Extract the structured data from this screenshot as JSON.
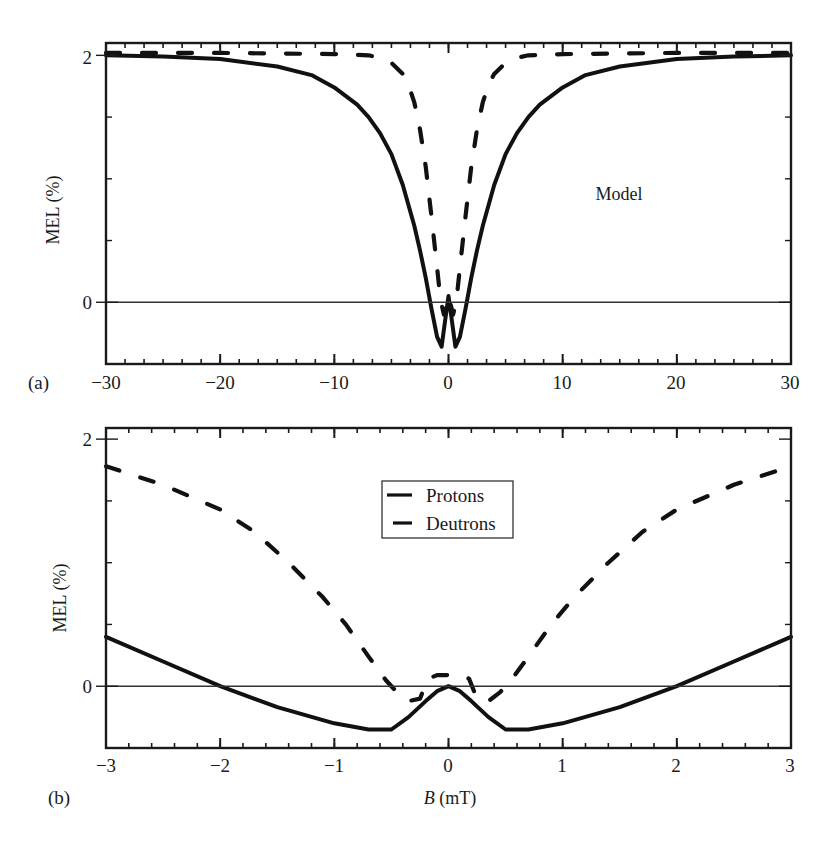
{
  "chart_data": [
    {
      "type": "line",
      "panel_label": "(a)",
      "title": "",
      "annotation": "Model",
      "xlabel": "",
      "ylabel": "MEL (%)",
      "xlim": [
        -30,
        30
      ],
      "ylim": [
        -0.5,
        2.1
      ],
      "xticks": [
        -30,
        -20,
        -10,
        0,
        10,
        20,
        30
      ],
      "xtick_labels": [
        "−30",
        "−20",
        "−10",
        "0",
        "10",
        "20",
        "30"
      ],
      "yticks": [
        0,
        2
      ],
      "ytick_labels": [
        "0",
        "2"
      ],
      "x_minor_step": 1.667,
      "y_minor_step": 0.5,
      "reference_line_y": 0,
      "grid": false,
      "legend": null,
      "series": [
        {
          "name": "Protons",
          "style": "solid",
          "x": [
            -30,
            -25,
            -20,
            -15,
            -12,
            -10,
            -8,
            -7,
            -6,
            -5,
            -4,
            -3,
            -2.5,
            -2,
            -1.5,
            -1,
            -0.6,
            -0.3,
            0,
            0.3,
            0.6,
            1,
            1.5,
            2,
            2.5,
            3,
            4,
            5,
            6,
            7,
            8,
            10,
            12,
            15,
            20,
            25,
            30
          ],
          "y": [
            2.0,
            1.99,
            1.97,
            1.91,
            1.84,
            1.74,
            1.6,
            1.5,
            1.37,
            1.2,
            0.95,
            0.62,
            0.42,
            0.2,
            -0.05,
            -0.28,
            -0.36,
            -0.15,
            0.05,
            -0.15,
            -0.36,
            -0.28,
            -0.05,
            0.2,
            0.42,
            0.62,
            0.95,
            1.2,
            1.37,
            1.5,
            1.6,
            1.74,
            1.84,
            1.91,
            1.97,
            1.99,
            2.0
          ]
        },
        {
          "name": "Deutrons",
          "style": "dashed",
          "x": [
            -30,
            -20,
            -10,
            -7,
            -6,
            -5,
            -4,
            -3.5,
            -3,
            -2.5,
            -2,
            -1.5,
            -1,
            -0.7,
            -0.4,
            0,
            0.4,
            0.7,
            1,
            1.5,
            2,
            2.5,
            3,
            3.5,
            4,
            5,
            6,
            7,
            10,
            20,
            30
          ],
          "y": [
            2.02,
            2.02,
            2.01,
            2.0,
            1.98,
            1.94,
            1.85,
            1.76,
            1.62,
            1.4,
            1.1,
            0.7,
            0.28,
            0.02,
            -0.1,
            0.05,
            -0.1,
            0.02,
            0.28,
            0.7,
            1.1,
            1.4,
            1.62,
            1.76,
            1.85,
            1.94,
            1.98,
            2.0,
            2.01,
            2.02,
            2.02
          ]
        }
      ]
    },
    {
      "type": "line",
      "panel_label": "(b)",
      "title": "",
      "xlabel": "B (mT)",
      "xlabel_italic_part": "B",
      "xlabel_rest": " (mT)",
      "ylabel": "MEL (%)",
      "xlim": [
        -3,
        3
      ],
      "ylim": [
        -0.5,
        2.09
      ],
      "xticks": [
        -3,
        -2,
        -1,
        0,
        1,
        2,
        3
      ],
      "xtick_labels": [
        "−3",
        "−2",
        "−1",
        "0",
        "1",
        "2",
        "3"
      ],
      "yticks": [
        0,
        2
      ],
      "ytick_labels": [
        "0",
        "2"
      ],
      "x_minor_step": 0.2,
      "y_minor_step": 0.5,
      "reference_line_y": 0,
      "grid": false,
      "legend": {
        "placement": "top-center",
        "entries": [
          {
            "label": "Protons",
            "style": "solid"
          },
          {
            "label": "Deutrons",
            "style": "dashed"
          }
        ]
      },
      "series": [
        {
          "name": "Protons",
          "style": "solid",
          "x": [
            -3,
            -2.5,
            -2,
            -1.5,
            -1,
            -0.7,
            -0.5,
            -0.35,
            -0.2,
            -0.1,
            0,
            0.1,
            0.2,
            0.35,
            0.5,
            0.7,
            1,
            1.5,
            2,
            2.5,
            3
          ],
          "y": [
            0.4,
            0.2,
            0.0,
            -0.17,
            -0.3,
            -0.35,
            -0.35,
            -0.25,
            -0.12,
            -0.04,
            0.0,
            -0.04,
            -0.12,
            -0.25,
            -0.35,
            -0.35,
            -0.3,
            -0.17,
            0.0,
            0.2,
            0.4
          ],
          "color": "#111111"
        },
        {
          "name": "Deutrons",
          "style": "dashed",
          "x": [
            -3,
            -2.5,
            -2,
            -1.7,
            -1.4,
            -1.1,
            -0.9,
            -0.7,
            -0.55,
            -0.45,
            -0.35,
            -0.25,
            -0.18,
            -0.1,
            0,
            0.1,
            0.18,
            0.25,
            0.35,
            0.45,
            0.55,
            0.7,
            0.9,
            1.1,
            1.4,
            1.7,
            2,
            2.5,
            3
          ],
          "y": [
            1.78,
            1.63,
            1.43,
            1.25,
            1.0,
            0.72,
            0.5,
            0.24,
            0.05,
            -0.05,
            -0.12,
            -0.1,
            0.06,
            0.09,
            0.09,
            0.09,
            0.06,
            -0.1,
            -0.12,
            -0.05,
            0.05,
            0.24,
            0.5,
            0.72,
            1.0,
            1.25,
            1.43,
            1.63,
            1.78
          ],
          "color": "#111111"
        }
      ]
    }
  ]
}
